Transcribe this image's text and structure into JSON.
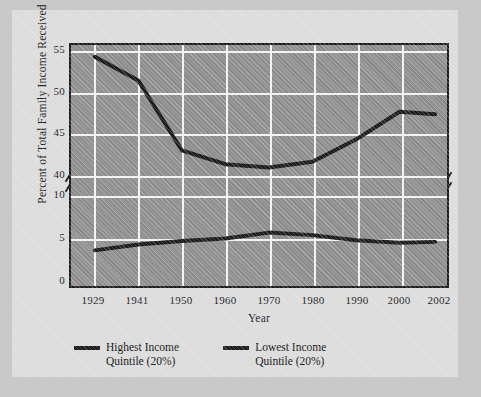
{
  "figure": {
    "background_color": "#dcdcdc",
    "page_color": "#c9c9c9",
    "plot_background_color": "#8e8e8e",
    "gridline_color": "#f2f2f2",
    "line_color": "#1c1c1c"
  },
  "chart_data": {
    "type": "line",
    "title": "",
    "xlabel": "Year",
    "ylabel": "Percent of Total Family Income Received",
    "x": [
      1929,
      1941,
      1950,
      1960,
      1970,
      1980,
      1990,
      2000,
      2002
    ],
    "categories": [
      "1929",
      "1941",
      "1950",
      "1960",
      "1970",
      "1980",
      "1990",
      "2000",
      "2002"
    ],
    "series": [
      {
        "name": "Highest Income Quintile (20%)",
        "values": [
          54.4,
          51.5,
          43.0,
          41.3,
          40.9,
          41.6,
          44.3,
          47.7,
          47.4
        ]
      },
      {
        "name": "Lowest Income Quintile (20%)",
        "values": [
          3.4,
          4.1,
          4.5,
          4.8,
          5.5,
          5.2,
          4.6,
          4.3,
          4.4
        ]
      }
    ],
    "ylim": [
      0,
      55
    ],
    "ytick_labels": [
      "55",
      "50",
      "45",
      "40",
      "10",
      "5",
      "0"
    ],
    "ytick_values": [
      55,
      50,
      45,
      40,
      10,
      5,
      0
    ],
    "axis_break": true,
    "axis_break_note": "y-axis broken between 40 and 10",
    "grid": true,
    "legend_position": "below-axis"
  },
  "legend": {
    "items": [
      {
        "label_line1": "Highest Income",
        "label_line2": "Quintile (20%)"
      },
      {
        "label_line1": "Lowest Income",
        "label_line2": "Quintile (20%)"
      }
    ]
  }
}
